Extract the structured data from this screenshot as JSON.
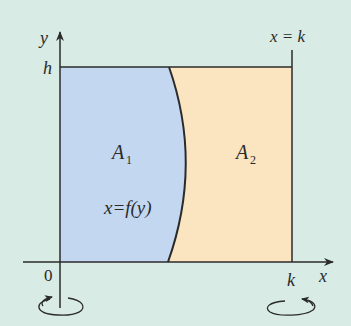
{
  "diagram": {
    "type": "region-under-curve",
    "colors": {
      "background": "#d8ebe4",
      "region_a1": "#c4d7f1",
      "region_a2": "#fbe4c0",
      "stroke": "#2b2b2b"
    },
    "axes": {
      "y_label": "y",
      "x_label": "x",
      "origin_label": "0",
      "h_label": "h",
      "k_label": "k"
    },
    "lines": {
      "vertical_line_label": "x = k"
    },
    "curve": {
      "label": "x=f(y)"
    },
    "regions": [
      {
        "name": "A",
        "subscript": "1"
      },
      {
        "name": "A",
        "subscript": "2"
      }
    ],
    "rotation_indicators": [
      {
        "axis": "y-axis",
        "direction": "counter-clockwise arrow at bottom of y-axis"
      },
      {
        "axis": "x = k",
        "direction": "rotation arrow below k"
      }
    ]
  }
}
